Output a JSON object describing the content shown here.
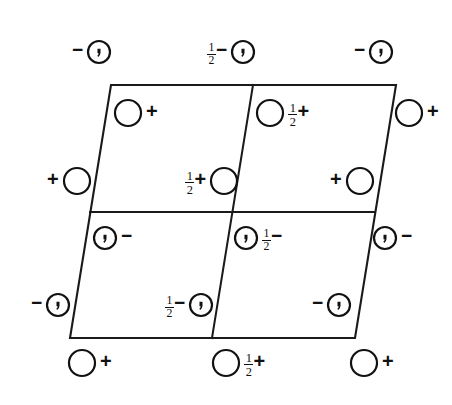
{
  "diagram": {
    "kind": "space-group-symmetry-diagram",
    "title": "",
    "line_color": "#1a1a1a",
    "symbol_color": "#111111",
    "background": "#ffffff",
    "cell": {
      "description": "oblique unit cell parallelogram divided into four quadrants",
      "corners": [
        {
          "name": "top-left",
          "x": 111,
          "y": 85
        },
        {
          "name": "top-right",
          "x": 396,
          "y": 85
        },
        {
          "name": "bottom-right",
          "x": 355,
          "y": 338
        },
        {
          "name": "bottom-left",
          "x": 70,
          "y": 338
        }
      ],
      "internal_lines": [
        {
          "name": "horizontal-mid",
          "x1": 90,
          "y1": 212,
          "x2": 375,
          "y2": 212
        },
        {
          "name": "vertical-mid",
          "x1": 253,
          "y1": 85,
          "x2": 212,
          "y2": 338
        }
      ]
    },
    "sites": [
      {
        "id": "s01",
        "cx": 99,
        "cy": 52,
        "r": 11,
        "glyph": "circle-comma",
        "label_text": "−",
        "label_side": "left",
        "height": ""
      },
      {
        "id": "s02",
        "cx": 243,
        "cy": 52,
        "r": 11,
        "glyph": "circle-comma",
        "label_text": "−",
        "label_side": "left",
        "height": "1/2"
      },
      {
        "id": "s03",
        "cx": 381,
        "cy": 52,
        "r": 11,
        "glyph": "circle-comma",
        "label_text": "−",
        "label_side": "left",
        "height": ""
      },
      {
        "id": "s04",
        "cx": 128,
        "cy": 113,
        "r": 13,
        "glyph": "circle-open",
        "label_text": "+",
        "label_side": "right",
        "height": ""
      },
      {
        "id": "s05",
        "cx": 270,
        "cy": 113,
        "r": 13,
        "glyph": "circle-open",
        "label_text": "+",
        "label_side": "right",
        "height": "1/2"
      },
      {
        "id": "s06",
        "cx": 409,
        "cy": 113,
        "r": 13,
        "glyph": "circle-open",
        "label_text": "+",
        "label_side": "right",
        "height": ""
      },
      {
        "id": "s07",
        "cx": 77,
        "cy": 181,
        "r": 13,
        "glyph": "circle-open",
        "label_text": "+",
        "label_side": "left",
        "height": ""
      },
      {
        "id": "s08",
        "cx": 224,
        "cy": 181,
        "r": 13,
        "glyph": "circle-open",
        "label_text": "+",
        "label_side": "left",
        "height": "1/2"
      },
      {
        "id": "s09",
        "cx": 360,
        "cy": 181,
        "r": 13,
        "glyph": "circle-open",
        "label_text": "+",
        "label_side": "left",
        "height": ""
      },
      {
        "id": "s10",
        "cx": 105,
        "cy": 238,
        "r": 11,
        "glyph": "circle-comma",
        "label_text": "−",
        "label_side": "right",
        "height": ""
      },
      {
        "id": "s11",
        "cx": 246,
        "cy": 238,
        "r": 11,
        "glyph": "circle-comma",
        "label_text": "−",
        "label_side": "right",
        "height": "1/2"
      },
      {
        "id": "s12",
        "cx": 385,
        "cy": 238,
        "r": 11,
        "glyph": "circle-comma",
        "label_text": "−",
        "label_side": "right",
        "height": ""
      },
      {
        "id": "s13",
        "cx": 58,
        "cy": 305,
        "r": 11,
        "glyph": "circle-comma",
        "label_text": "−",
        "label_side": "left",
        "height": ""
      },
      {
        "id": "s14",
        "cx": 201,
        "cy": 305,
        "r": 11,
        "glyph": "circle-comma",
        "label_text": "−",
        "label_side": "left",
        "height": "1/2"
      },
      {
        "id": "s15",
        "cx": 339,
        "cy": 305,
        "r": 11,
        "glyph": "circle-comma",
        "label_text": "−",
        "label_side": "left",
        "height": ""
      },
      {
        "id": "s16",
        "cx": 82,
        "cy": 363,
        "r": 13,
        "glyph": "circle-open",
        "label_text": "+",
        "label_side": "right",
        "height": ""
      },
      {
        "id": "s17",
        "cx": 226,
        "cy": 363,
        "r": 13,
        "glyph": "circle-open",
        "label_text": "+",
        "label_side": "right",
        "height": "1/2"
      },
      {
        "id": "s18",
        "cx": 364,
        "cy": 363,
        "r": 13,
        "glyph": "circle-open",
        "label_text": "+",
        "label_side": "right",
        "height": ""
      }
    ]
  }
}
